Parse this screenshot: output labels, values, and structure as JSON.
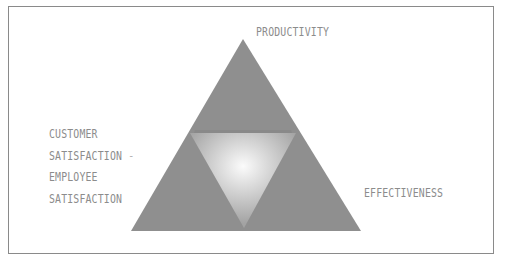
{
  "diagram": {
    "type": "triangle-model",
    "labels": {
      "top": "PRODUCTIVITY",
      "left_lines": [
        "CUSTOMER",
        "SATISFACTION",
        "EMPLOYEE",
        "SATISFACTION"
      ],
      "left_separator": "-",
      "right": "EFFECTIVENESS"
    },
    "colors": {
      "outer_triangle": "#8f8f8f",
      "center_glow": "#f8f8f8",
      "center_edge": "#a6a6a6",
      "label_text": "#8c8c8c",
      "frame_border": "#8a8a8a"
    }
  }
}
